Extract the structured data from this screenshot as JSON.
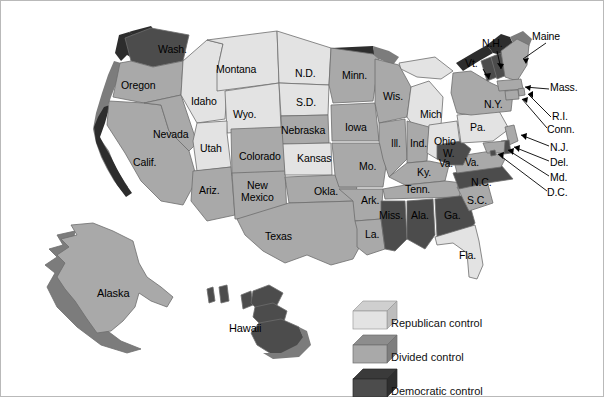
{
  "document": {
    "type": "thematic-choropleth-map",
    "subject": "United States state government partisan control",
    "background_color": "#ffffff",
    "border_color": "#b9b9b9"
  },
  "legend": {
    "items": [
      {
        "key": "republican",
        "label": "Republican control",
        "fill": "#e3e3e3",
        "top_face": "#cfcfcf",
        "side_face": "#bdbdbd"
      },
      {
        "key": "divided",
        "label": "Divided control",
        "fill": "#a9a9a9",
        "top_face": "#8d8d8d",
        "side_face": "#7e7e7e"
      },
      {
        "key": "democratic",
        "label": "Democratic control",
        "fill": "#4c4c4c",
        "top_face": "#3a3a3a",
        "side_face": "#2e2e2e"
      }
    ]
  },
  "map": {
    "outline_color": "#6d6d6d",
    "label_color": "#000000",
    "leader_line_color": "#000000",
    "states": [
      {
        "name": "Wash.",
        "control": "democratic",
        "label_x": 157,
        "label_y": 48
      },
      {
        "name": "Oregon",
        "control": "divided",
        "label_x": 126,
        "label_y": 84
      },
      {
        "name": "Calif.",
        "control": "divided",
        "label_x": 137,
        "label_y": 161
      },
      {
        "name": "Nevada",
        "control": "divided",
        "label_x": 159,
        "label_y": 133
      },
      {
        "name": "Idaho",
        "control": "republican",
        "label_x": 194,
        "label_y": 100
      },
      {
        "name": "Montana",
        "control": "republican",
        "label_x": 222,
        "label_y": 68
      },
      {
        "name": "Wyo.",
        "control": "republican",
        "label_x": 239,
        "label_y": 113
      },
      {
        "name": "Utah",
        "control": "republican",
        "label_x": 203,
        "label_y": 147
      },
      {
        "name": "Ariz.",
        "control": "divided",
        "label_x": 201,
        "label_y": 189
      },
      {
        "name": "New",
        "control": "divided",
        "label_x": 246,
        "label_y": 184
      },
      {
        "name": "Mexico",
        "control": "divided",
        "label_x": 242,
        "label_y": 196
      },
      {
        "name": "Colorado",
        "control": "divided",
        "label_x": 244,
        "label_y": 155
      },
      {
        "name": "N.D.",
        "control": "republican",
        "label_x": 298,
        "label_y": 72
      },
      {
        "name": "S.D.",
        "control": "republican",
        "label_x": 299,
        "label_y": 101
      },
      {
        "name": "Nebraska",
        "control": "divided",
        "label_x": 285,
        "label_y": 129
      },
      {
        "name": "Kansas",
        "control": "republican",
        "label_x": 302,
        "label_y": 157
      },
      {
        "name": "Okla.",
        "control": "divided",
        "label_x": 317,
        "label_y": 190
      },
      {
        "name": "Texas",
        "control": "divided",
        "label_x": 268,
        "label_y": 235
      },
      {
        "name": "Minn.",
        "control": "divided",
        "label_x": 345,
        "label_y": 74
      },
      {
        "name": "Iowa",
        "control": "divided",
        "label_x": 347,
        "label_y": 126
      },
      {
        "name": "Mo.",
        "control": "divided",
        "label_x": 361,
        "label_y": 165
      },
      {
        "name": "Ark.",
        "control": "divided",
        "label_x": 364,
        "label_y": 199
      },
      {
        "name": "La.",
        "control": "divided",
        "label_x": 367,
        "label_y": 233
      },
      {
        "name": "Wis.",
        "control": "divided",
        "label_x": 386,
        "label_y": 95
      },
      {
        "name": "Ill.",
        "control": "divided",
        "label_x": 390,
        "label_y": 142
      },
      {
        "name": "Miss.",
        "control": "democratic",
        "label_x": 387,
        "label_y": 214
      },
      {
        "name": "Ind.",
        "control": "divided",
        "label_x": 414,
        "label_y": 142
      },
      {
        "name": "Ala.",
        "control": "democratic",
        "label_x": 416,
        "label_y": 214
      },
      {
        "name": "Mich",
        "control": "republican",
        "label_x": 424,
        "label_y": 113
      },
      {
        "name": "Ky.",
        "control": "divided",
        "label_x": 420,
        "label_y": 171
      },
      {
        "name": "Tenn.",
        "control": "divided",
        "label_x": 411,
        "label_y": 188
      },
      {
        "name": "Ohio",
        "control": "republican",
        "label_x": 440,
        "label_y": 140
      },
      {
        "name": "Ga.",
        "control": "democratic",
        "label_x": 447,
        "label_y": 214
      },
      {
        "name": "Fla.",
        "control": "republican",
        "label_x": 462,
        "label_y": 254
      },
      {
        "name": "S.C.",
        "control": "divided",
        "label_x": 470,
        "label_y": 199
      },
      {
        "name": "N.C.",
        "control": "democratic",
        "label_x": 474,
        "label_y": 181
      },
      {
        "name": "W.",
        "control": "democratic",
        "label_x": 444,
        "label_y": 152
      },
      {
        "name": "Va.",
        "control": "democratic",
        "label_x": 442,
        "label_y": 162
      },
      {
        "name": "Va.",
        "control": "divided",
        "label_x": 467,
        "label_y": 161
      },
      {
        "name": "Pa.",
        "control": "republican",
        "label_x": 473,
        "label_y": 126
      },
      {
        "name": "N.Y.",
        "control": "divided",
        "label_x": 488,
        "label_y": 103
      },
      {
        "name": "Vt.",
        "control": "democratic",
        "label_x": 469,
        "label_y": 62
      },
      {
        "name": "N.H.",
        "control": "democratic",
        "label_x": 485,
        "label_y": 42
      },
      {
        "name": "Maine",
        "control": "divided",
        "label_x": 534,
        "label_y": 35
      },
      {
        "name": "Mass.",
        "control": "divided",
        "label_x": 551,
        "label_y": 85
      },
      {
        "name": "R.I.",
        "control": "divided",
        "label_x": 553,
        "label_y": 115
      },
      {
        "name": "Conn.",
        "control": "divided",
        "label_x": 548,
        "label_y": 128
      },
      {
        "name": "N.J.",
        "control": "divided",
        "label_x": 551,
        "label_y": 146
      },
      {
        "name": "Del.",
        "control": "divided",
        "label_x": 551,
        "label_y": 161
      },
      {
        "name": "Md.",
        "control": "divided",
        "label_x": 551,
        "label_y": 176
      },
      {
        "name": "D.C.",
        "control": "divided",
        "label_x": 548,
        "label_y": 191
      },
      {
        "name": "Alaska",
        "control": "divided",
        "label_x": 100,
        "label_y": 292
      },
      {
        "name": "Hawaii",
        "control": "democratic",
        "label_x": 232,
        "label_y": 327
      }
    ]
  }
}
